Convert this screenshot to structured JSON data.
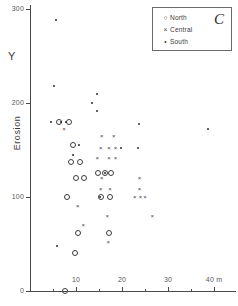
{
  "panel": {
    "letter": "C"
  },
  "axes": {
    "y_symbol": "Y",
    "y_title": "Erosion",
    "y_ticks": [
      {
        "label": "0",
        "value": 0
      },
      {
        "label": "100",
        "value": 100
      },
      {
        "label": "200",
        "value": 200
      },
      {
        "label": "300",
        "value": 300
      }
    ],
    "x_ticks": [
      {
        "label": "10",
        "value": 10
      },
      {
        "label": "20",
        "value": 20
      },
      {
        "label": "30",
        "value": 30
      },
      {
        "label": "40 m",
        "value": 40
      }
    ]
  },
  "legend": {
    "items": [
      {
        "label": "North",
        "mark": "circle-marker",
        "glyph": "○"
      },
      {
        "label": "Central",
        "mark": "cross-marker",
        "glyph": "×"
      },
      {
        "label": "South",
        "mark": "dot-marker",
        "glyph": "•"
      }
    ]
  },
  "chart_data": {
    "type": "scatter",
    "title": "",
    "xlabel": "40 m",
    "ylabel": "Erosion",
    "xlim": [
      0,
      42
    ],
    "ylim": [
      0,
      300
    ],
    "grid": false,
    "legend_position": "top-right",
    "series": [
      {
        "name": "North",
        "marker": "open-circle",
        "color": "#3d3d3d",
        "points": [
          [
            6.2,
            180
          ],
          [
            8.5,
            180
          ],
          [
            9.4,
            155
          ],
          [
            9.0,
            137
          ],
          [
            10.8,
            137
          ],
          [
            10.0,
            120
          ],
          [
            11.8,
            120
          ],
          [
            8.0,
            100
          ],
          [
            14.8,
            126
          ],
          [
            16.3,
            126
          ],
          [
            17.6,
            126
          ],
          [
            15.4,
            100
          ],
          [
            17.4,
            100
          ],
          [
            10.4,
            62
          ],
          [
            17.2,
            62
          ],
          [
            9.8,
            40
          ],
          [
            7.6,
            0
          ]
        ]
      },
      {
        "name": "Central",
        "marker": "cross",
        "color": "#3d3d3d",
        "points": [
          [
            7.4,
            172
          ],
          [
            15.6,
            165
          ],
          [
            18.2,
            165
          ],
          [
            15.4,
            152
          ],
          [
            17.2,
            152
          ],
          [
            18.6,
            152
          ],
          [
            14.6,
            142
          ],
          [
            17.2,
            142
          ],
          [
            18.6,
            142
          ],
          [
            15.6,
            120
          ],
          [
            23.8,
            120
          ],
          [
            15.4,
            108
          ],
          [
            17.4,
            108
          ],
          [
            23.8,
            108
          ],
          [
            22.8,
            100
          ],
          [
            24.0,
            100
          ],
          [
            25.0,
            100
          ],
          [
            10.4,
            90
          ],
          [
            16.8,
            80
          ],
          [
            26.6,
            80
          ],
          [
            11.6,
            70
          ],
          [
            17.0,
            52
          ]
        ]
      },
      {
        "name": "South",
        "marker": "dot",
        "color": "#2b2b2b",
        "points": [
          [
            5.6,
            288
          ],
          [
            5.2,
            218
          ],
          [
            14.6,
            210
          ],
          [
            13.4,
            200
          ],
          [
            14.6,
            192
          ],
          [
            4.6,
            180
          ],
          [
            6.8,
            180
          ],
          [
            7.8,
            180
          ],
          [
            10.6,
            155
          ],
          [
            9.4,
            145
          ],
          [
            23.6,
            178
          ],
          [
            38.6,
            172
          ],
          [
            19.8,
            152
          ],
          [
            23.4,
            152
          ],
          [
            16.2,
            126
          ],
          [
            15.2,
            100
          ],
          [
            5.8,
            48
          ]
        ]
      }
    ]
  }
}
